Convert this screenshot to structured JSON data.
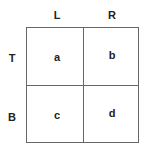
{
  "columns": [
    "L",
    "R"
  ],
  "rows": [
    "T",
    "B"
  ],
  "cells": [
    [
      "a",
      "b"
    ],
    [
      "c",
      "d"
    ]
  ]
}
